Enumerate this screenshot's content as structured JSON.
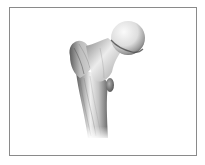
{
  "figure": {
    "frame_color": "#8a8a8a",
    "background_color": "#ffffff",
    "bone_colors": {
      "highlight": "#f4f4f4",
      "midtone": "#c8c8c8",
      "shadow": "#6e6e6e",
      "deep_shadow": "#4a4a4a"
    },
    "parts": [
      {
        "name": "femoral-head"
      },
      {
        "name": "femoral-neck"
      },
      {
        "name": "greater-trochanter"
      },
      {
        "name": "lesser-trochanter"
      },
      {
        "name": "femoral-shaft"
      }
    ]
  }
}
